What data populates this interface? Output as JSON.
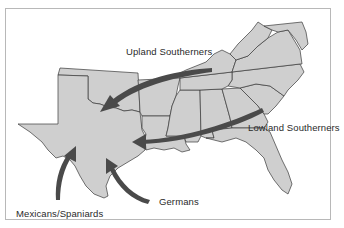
{
  "map": {
    "title": "",
    "background_color": "#ffffff",
    "land_color": "#cfcfcf",
    "border_color": "#3a3a3a",
    "arrow_color": "#4a4a4a",
    "region": "Southern United States",
    "highlighted_state": "Texas",
    "labels": {
      "upland": "Upland Southerners",
      "lowland": "Lowland Southerners",
      "germans": "Germans",
      "mexicans": "Mexicans/Spaniards"
    },
    "migration_flows": [
      {
        "group": "Upland Southerners",
        "from": "Kentucky/Tennessee",
        "to": "North Texas"
      },
      {
        "group": "Lowland Southerners",
        "from": "Georgia/Carolinas",
        "to": "East Texas"
      },
      {
        "group": "Germans",
        "from": "Gulf Coast",
        "to": "Central Texas"
      },
      {
        "group": "Mexicans/Spaniards",
        "from": "South",
        "to": "South Texas"
      }
    ]
  }
}
